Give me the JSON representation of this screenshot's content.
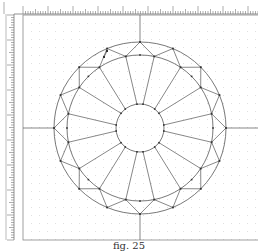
{
  "caption": "fig. 25",
  "colors": {
    "background": "#ffffff",
    "line": "#555555",
    "ruler": "#777777",
    "grid_dot": "#cfcfcf",
    "vertex": "#333333",
    "border": "#888888"
  },
  "ruler": {
    "horizontal": {
      "y": 5,
      "height": 9,
      "x_start": 14,
      "x_end": 258,
      "minor_step": 2.5,
      "major_every": 10
    },
    "vertical": {
      "x": 6,
      "width": 8,
      "y_start": 14,
      "y_end": 240,
      "minor_step": 2.5,
      "major_every": 10
    }
  },
  "drawing_area": {
    "x": 23,
    "y": 15,
    "width": 235,
    "height": 225,
    "grid_step": 8
  },
  "diagram": {
    "center": {
      "x": 140,
      "y": 128
    },
    "girdle_radius": 86,
    "crown_radius": 73,
    "table_radius": 24,
    "facet_count": 16,
    "axis_lines": true
  }
}
